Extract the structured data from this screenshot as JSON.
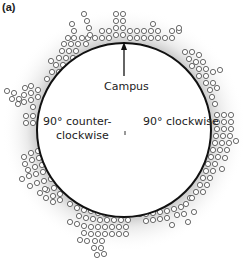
{
  "panel_label": "(a)",
  "labels": {
    "campus": "Campus",
    "ccw_line1": "90° counter-",
    "ccw_line2": "clockwise",
    "cw": "90° clockwise"
  },
  "colors": {
    "ring": "#111111",
    "dot_stroke": "#444444",
    "halo": "#d8d8d8"
  },
  "circle": {
    "cx": 124,
    "cy": 130,
    "r": 87
  },
  "dot_clusters": [
    {
      "name": "top",
      "points": [
        [
          116,
          14
        ],
        [
          123,
          14
        ],
        [
          116,
          21
        ],
        [
          123,
          21
        ],
        [
          116,
          28
        ],
        [
          123,
          28
        ],
        [
          116,
          35
        ],
        [
          123,
          35
        ],
        [
          102,
          31
        ],
        [
          109,
          31
        ],
        [
          102,
          38
        ],
        [
          109,
          38
        ],
        [
          130,
          31
        ],
        [
          137,
          31
        ],
        [
          144,
          31
        ],
        [
          151,
          31
        ],
        [
          158,
          31
        ],
        [
          130,
          38
        ],
        [
          137,
          38
        ],
        [
          144,
          38
        ],
        [
          151,
          38
        ],
        [
          158,
          38
        ],
        [
          165,
          38
        ],
        [
          95,
          38
        ],
        [
          88,
          38
        ],
        [
          153,
          24
        ],
        [
          172,
          31
        ],
        [
          179,
          31
        ],
        [
          172,
          38
        ],
        [
          179,
          28
        ]
      ]
    },
    {
      "name": "upper-left",
      "points": [
        [
          84,
          14
        ],
        [
          87,
          21
        ],
        [
          89,
          28
        ],
        [
          90,
          35
        ],
        [
          72,
          24
        ],
        [
          74,
          31
        ],
        [
          68,
          38
        ],
        [
          74,
          38
        ],
        [
          82,
          38
        ],
        [
          64,
          44
        ],
        [
          71,
          44
        ],
        [
          78,
          44
        ],
        [
          86,
          44
        ],
        [
          62,
          51
        ],
        [
          69,
          51
        ],
        [
          76,
          51
        ],
        [
          59,
          58
        ],
        [
          66,
          58
        ],
        [
          73,
          58
        ],
        [
          56,
          65
        ],
        [
          63,
          65
        ],
        [
          52,
          72
        ],
        [
          59,
          72
        ],
        [
          51,
          61
        ],
        [
          47,
          79
        ]
      ]
    },
    {
      "name": "upper-right",
      "points": [
        [
          185,
          52
        ],
        [
          192,
          52
        ],
        [
          199,
          55
        ],
        [
          189,
          59
        ],
        [
          196,
          62
        ],
        [
          203,
          62
        ],
        [
          192,
          66
        ],
        [
          199,
          69
        ],
        [
          206,
          69
        ],
        [
          199,
          76
        ],
        [
          206,
          76
        ],
        [
          213,
          72
        ],
        [
          220,
          70
        ],
        [
          206,
          83
        ],
        [
          213,
          83
        ],
        [
          210,
          90
        ],
        [
          217,
          88
        ],
        [
          212,
          97
        ],
        [
          215,
          104
        ]
      ]
    },
    {
      "name": "left",
      "points": [
        [
          7,
          91
        ],
        [
          14,
          93
        ],
        [
          12,
          99
        ],
        [
          19,
          99
        ],
        [
          25,
          88
        ],
        [
          31,
          86
        ],
        [
          24,
          95
        ],
        [
          31,
          93
        ],
        [
          38,
          90
        ],
        [
          18,
          104
        ],
        [
          24,
          102
        ],
        [
          31,
          100
        ],
        [
          38,
          97
        ],
        [
          33,
          107
        ],
        [
          26,
          116
        ],
        [
          33,
          116
        ],
        [
          26,
          123
        ],
        [
          33,
          123
        ]
      ]
    },
    {
      "name": "right",
      "points": [
        [
          217,
          115
        ],
        [
          224,
          115
        ],
        [
          231,
          115
        ],
        [
          217,
          122
        ],
        [
          224,
          122
        ],
        [
          231,
          122
        ],
        [
          217,
          129
        ],
        [
          224,
          129
        ],
        [
          231,
          129
        ],
        [
          216,
          136
        ],
        [
          223,
          136
        ],
        [
          230,
          136
        ],
        [
          215,
          143
        ],
        [
          222,
          143
        ],
        [
          229,
          143
        ],
        [
          236,
          141
        ],
        [
          213,
          150
        ],
        [
          220,
          150
        ],
        [
          227,
          150
        ],
        [
          211,
          157
        ],
        [
          218,
          157
        ],
        [
          225,
          158
        ],
        [
          208,
          164
        ],
        [
          215,
          164
        ],
        [
          206,
          171
        ],
        [
          213,
          171
        ],
        [
          222,
          169
        ],
        [
          203,
          178
        ],
        [
          210,
          178
        ],
        [
          200,
          185
        ],
        [
          207,
          185
        ],
        [
          196,
          192
        ],
        [
          203,
          192
        ]
      ]
    },
    {
      "name": "lower-left",
      "points": [
        [
          24,
          157
        ],
        [
          31,
          153
        ],
        [
          38,
          151
        ],
        [
          25,
          164
        ],
        [
          32,
          160
        ],
        [
          39,
          158
        ],
        [
          28,
          170
        ],
        [
          35,
          167
        ],
        [
          42,
          165
        ],
        [
          22,
          179
        ],
        [
          29,
          176
        ],
        [
          36,
          174
        ],
        [
          43,
          172
        ],
        [
          30,
          186
        ],
        [
          37,
          183
        ],
        [
          44,
          181
        ],
        [
          51,
          179
        ],
        [
          40,
          193
        ],
        [
          47,
          190
        ],
        [
          54,
          188
        ],
        [
          46,
          198
        ],
        [
          53,
          196
        ],
        [
          60,
          194
        ],
        [
          53,
          202
        ],
        [
          60,
          200
        ],
        [
          45,
          189
        ]
      ]
    },
    {
      "name": "bottom",
      "points": [
        [
          70,
          204
        ],
        [
          77,
          208
        ],
        [
          84,
          210
        ],
        [
          91,
          211
        ],
        [
          98,
          213
        ],
        [
          105,
          214
        ],
        [
          112,
          214
        ],
        [
          119,
          214
        ],
        [
          126,
          214
        ],
        [
          133,
          214
        ],
        [
          140,
          214
        ],
        [
          79,
          216
        ],
        [
          86,
          218
        ],
        [
          93,
          219
        ],
        [
          100,
          220
        ],
        [
          107,
          220
        ],
        [
          114,
          220
        ],
        [
          121,
          220
        ],
        [
          128,
          220
        ],
        [
          70,
          222
        ],
        [
          77,
          224
        ],
        [
          84,
          226
        ],
        [
          91,
          227
        ],
        [
          98,
          227
        ],
        [
          105,
          227
        ],
        [
          112,
          227
        ],
        [
          119,
          227
        ],
        [
          126,
          227
        ],
        [
          84,
          233
        ],
        [
          91,
          234
        ],
        [
          98,
          234
        ],
        [
          105,
          234
        ],
        [
          112,
          234
        ],
        [
          119,
          234
        ],
        [
          126,
          234
        ],
        [
          80,
          240
        ],
        [
          87,
          241
        ],
        [
          95,
          241
        ],
        [
          102,
          241
        ],
        [
          94,
          248
        ],
        [
          101,
          248
        ],
        [
          97,
          255
        ],
        [
          104,
          254
        ]
      ]
    },
    {
      "name": "lower-right",
      "points": [
        [
          146,
          214
        ],
        [
          153,
          213
        ],
        [
          160,
          212
        ],
        [
          167,
          211
        ],
        [
          174,
          209
        ],
        [
          181,
          207
        ],
        [
          186,
          204
        ],
        [
          146,
          221
        ],
        [
          153,
          220
        ],
        [
          160,
          219
        ],
        [
          167,
          218
        ],
        [
          177,
          215
        ],
        [
          184,
          214
        ],
        [
          172,
          225
        ],
        [
          188,
          222
        ],
        [
          194,
          212
        ],
        [
          190,
          198
        ],
        [
          192,
          198
        ]
      ]
    }
  ]
}
